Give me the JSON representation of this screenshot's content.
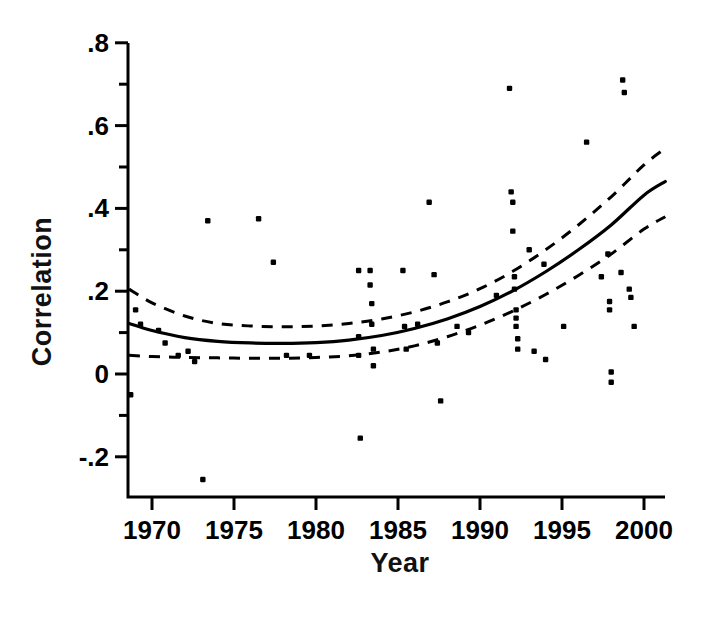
{
  "chart_data": {
    "type": "scatter",
    "title": "",
    "xlabel": "Year",
    "ylabel": "Correlation",
    "xlim": [
      1968.5,
      2001.3
    ],
    "ylim": [
      -0.27,
      0.8
    ],
    "grid": false,
    "legend": null,
    "x_ticks": [
      1970,
      1975,
      1980,
      1985,
      1990,
      1995,
      2000
    ],
    "x_tick_labels": [
      "1970",
      "1975",
      "1980",
      "1985",
      "1990",
      "1995",
      "2000"
    ],
    "x_minor_ticks": [],
    "y_ticks": [
      -0.2,
      0,
      0.2,
      0.4,
      0.6,
      0.8
    ],
    "y_tick_labels": [
      "-.2",
      "0",
      ".2",
      ".4",
      ".6",
      ".8"
    ],
    "y_minor_ticks": [
      -0.1,
      0.1,
      0.3,
      0.5,
      0.7
    ],
    "marker": "filled-square-dot",
    "marker_color": "#000000",
    "points": [
      [
        1968.7,
        -0.05
      ],
      [
        1969.0,
        0.155
      ],
      [
        1969.3,
        0.12
      ],
      [
        1970.4,
        0.105
      ],
      [
        1970.8,
        0.075
      ],
      [
        1971.6,
        0.045
      ],
      [
        1972.2,
        0.055
      ],
      [
        1972.6,
        0.03
      ],
      [
        1973.1,
        -0.255
      ],
      [
        1973.4,
        0.37
      ],
      [
        1976.5,
        0.375
      ],
      [
        1977.4,
        0.27
      ],
      [
        1978.2,
        0.045
      ],
      [
        1979.6,
        0.045
      ],
      [
        1982.6,
        0.25
      ],
      [
        1982.6,
        0.09
      ],
      [
        1982.6,
        0.045
      ],
      [
        1982.7,
        -0.155
      ],
      [
        1983.3,
        0.25
      ],
      [
        1983.3,
        0.215
      ],
      [
        1983.4,
        0.17
      ],
      [
        1983.4,
        0.12
      ],
      [
        1983.5,
        0.06
      ],
      [
        1983.5,
        0.02
      ],
      [
        1985.3,
        0.25
      ],
      [
        1985.4,
        0.115
      ],
      [
        1985.5,
        0.06
      ],
      [
        1986.2,
        0.12
      ],
      [
        1986.9,
        0.415
      ],
      [
        1987.2,
        0.24
      ],
      [
        1987.4,
        0.075
      ],
      [
        1987.6,
        -0.065
      ],
      [
        1988.6,
        0.115
      ],
      [
        1989.3,
        0.1
      ],
      [
        1991.0,
        0.19
      ],
      [
        1991.8,
        0.69
      ],
      [
        1991.9,
        0.44
      ],
      [
        1992.0,
        0.415
      ],
      [
        1992.0,
        0.345
      ],
      [
        1992.1,
        0.235
      ],
      [
        1992.1,
        0.205
      ],
      [
        1992.2,
        0.155
      ],
      [
        1992.2,
        0.135
      ],
      [
        1992.2,
        0.115
      ],
      [
        1992.3,
        0.085
      ],
      [
        1992.3,
        0.06
      ],
      [
        1993.0,
        0.3
      ],
      [
        1993.3,
        0.055
      ],
      [
        1993.9,
        0.265
      ],
      [
        1994.0,
        0.035
      ],
      [
        1995.1,
        0.115
      ],
      [
        1996.5,
        0.56
      ],
      [
        1997.4,
        0.235
      ],
      [
        1997.8,
        0.29
      ],
      [
        1997.9,
        0.175
      ],
      [
        1997.9,
        0.155
      ],
      [
        1998.0,
        0.005
      ],
      [
        1998.0,
        -0.02
      ],
      [
        1998.6,
        0.245
      ],
      [
        1998.7,
        0.71
      ],
      [
        1998.8,
        0.68
      ],
      [
        1999.1,
        0.205
      ],
      [
        1999.2,
        0.185
      ],
      [
        1999.4,
        0.115
      ]
    ],
    "fit_curve": {
      "name": "fitted-regression-curve",
      "style": "solid",
      "x": [
        1968.6,
        1970,
        1972,
        1974,
        1976,
        1978,
        1980,
        1982,
        1984,
        1986,
        1988,
        1990,
        1992,
        1994,
        1996,
        1998,
        2000,
        2001.3
      ],
      "y": [
        0.122,
        0.105,
        0.088,
        0.079,
        0.075,
        0.074,
        0.076,
        0.082,
        0.093,
        0.11,
        0.133,
        0.163,
        0.201,
        0.247,
        0.3,
        0.36,
        0.432,
        0.465
      ]
    },
    "confidence_bands": [
      {
        "name": "upper-confidence-band",
        "style": "dashed",
        "x": [
          1968.6,
          1970,
          1972,
          1974,
          1976,
          1978,
          1980,
          1982,
          1984,
          1986,
          1988,
          1990,
          1992,
          1994,
          1996,
          1998,
          2000,
          2001.3
        ],
        "y": [
          0.205,
          0.172,
          0.14,
          0.122,
          0.116,
          0.114,
          0.116,
          0.122,
          0.133,
          0.15,
          0.174,
          0.206,
          0.248,
          0.3,
          0.36,
          0.428,
          0.505,
          0.545
        ]
      },
      {
        "name": "lower-confidence-band",
        "style": "dashed",
        "x": [
          1968.6,
          1970,
          1972,
          1974,
          1976,
          1978,
          1980,
          1982,
          1984,
          1986,
          1988,
          1990,
          1992,
          1994,
          1996,
          1998,
          2000,
          2001.3
        ],
        "y": [
          0.045,
          0.042,
          0.04,
          0.039,
          0.038,
          0.038,
          0.04,
          0.044,
          0.053,
          0.068,
          0.09,
          0.118,
          0.152,
          0.192,
          0.238,
          0.29,
          0.35,
          0.38
        ]
      }
    ]
  },
  "axes": {
    "y_axis_label": "Correlation",
    "x_axis_label": "Year"
  },
  "colors": {
    "ink": "#000000",
    "background": "#ffffff"
  }
}
